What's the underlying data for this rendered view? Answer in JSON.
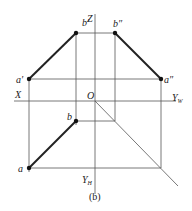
{
  "diagram": {
    "caption": "(b)",
    "axes": {
      "x_label": "X",
      "z_label": "Z",
      "origin_label": "O",
      "yw_label": "Y",
      "yw_sub": "W",
      "yh_label": "Y",
      "yh_sub": "H"
    },
    "points": {
      "a_prime": "a′",
      "b_prime": "b′",
      "a_double_prime": "a″",
      "b_double_prime": "b″",
      "a": "a",
      "b": "b"
    },
    "colors": {
      "line": "#222222",
      "thin_line": "#555555",
      "background": "#ffffff"
    }
  }
}
